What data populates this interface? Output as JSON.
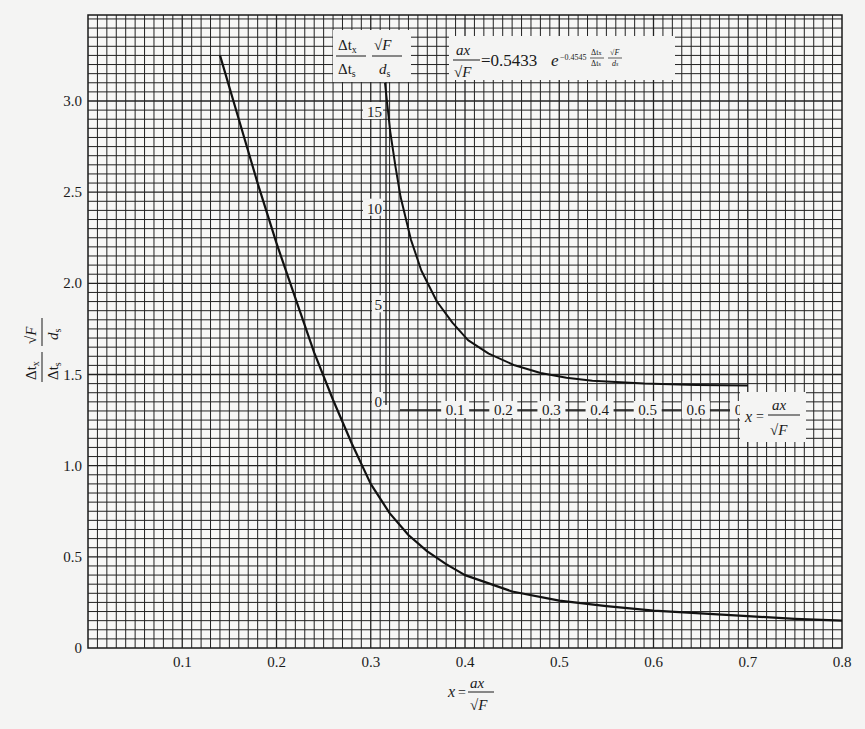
{
  "chart_data": [
    {
      "type": "line",
      "title": "",
      "xlabel": "x = ax/√F",
      "ylabel": "(Δt_x/Δt_s)·(√F/d_s)",
      "xlim": [
        0,
        0.8
      ],
      "ylim": [
        0,
        3.25
      ],
      "grid": true,
      "x_ticks": [
        "0.1",
        "0.2",
        "0.3",
        "0.4",
        "0.5",
        "0.6",
        "0.7",
        "0.8"
      ],
      "y_ticks": [
        "0",
        "0.5",
        "1.0",
        "1.5",
        "2.0",
        "2.5",
        "3.0"
      ],
      "series": [
        {
          "name": "main curve",
          "x": [
            0.14,
            0.16,
            0.18,
            0.2,
            0.22,
            0.24,
            0.26,
            0.28,
            0.3,
            0.32,
            0.34,
            0.36,
            0.38,
            0.4,
            0.45,
            0.5,
            0.55,
            0.6,
            0.65,
            0.7,
            0.75,
            0.8
          ],
          "y": [
            3.25,
            2.9,
            2.55,
            2.22,
            1.92,
            1.62,
            1.36,
            1.12,
            0.9,
            0.74,
            0.62,
            0.53,
            0.46,
            0.4,
            0.31,
            0.26,
            0.23,
            0.205,
            0.19,
            0.175,
            0.16,
            0.15
          ]
        }
      ]
    },
    {
      "type": "line",
      "title": "inset",
      "xlabel": "x = ax/√F",
      "ylabel": "(Δt_x/Δt_s)·(√F/d_s)",
      "xlim": [
        0,
        0.75
      ],
      "ylim": [
        0,
        17
      ],
      "grid": true,
      "x_ticks": [
        "0.1",
        "0.2",
        "0.3",
        "0.4",
        "0.5",
        "0.6",
        "0.7"
      ],
      "y_ticks": [
        "0",
        "5",
        "10",
        "15"
      ],
      "annotation": "ax/√F = 0.5433 e^(−0.4545 (Δt_x/Δt_s)(√F/d_s))",
      "series": [
        {
          "name": "inset curve",
          "x": [
            0.0,
            0.01,
            0.02,
            0.03,
            0.05,
            0.07,
            0.1,
            0.13,
            0.16,
            0.2,
            0.25,
            0.3,
            0.35,
            0.4,
            0.5,
            0.6,
            0.7
          ],
          "y": [
            16.5,
            14.0,
            12.2,
            10.6,
            8.4,
            6.8,
            5.2,
            4.1,
            3.2,
            2.5,
            1.9,
            1.5,
            1.25,
            1.1,
            0.95,
            0.88,
            0.85
          ]
        }
      ]
    }
  ],
  "labels": {
    "y_axis_num": "Δt",
    "y_axis_num_sub": "x",
    "y_axis_den": "Δt",
    "y_axis_den_sub": "s",
    "y_axis_sqrt": "√F",
    "y_axis_d": "d",
    "y_axis_d_sub": "s",
    "x_axis_x": "x",
    "x_axis_eq": "=",
    "x_axis_num": "ax",
    "x_axis_den": "√F",
    "inset_formula_lhs_num": "ax",
    "inset_formula_lhs_den": "√F",
    "inset_formula_rhs": "=0.5433",
    "inset_formula_e": "e",
    "inset_formula_exp": "−0.4545",
    "inset_origin": "0"
  }
}
